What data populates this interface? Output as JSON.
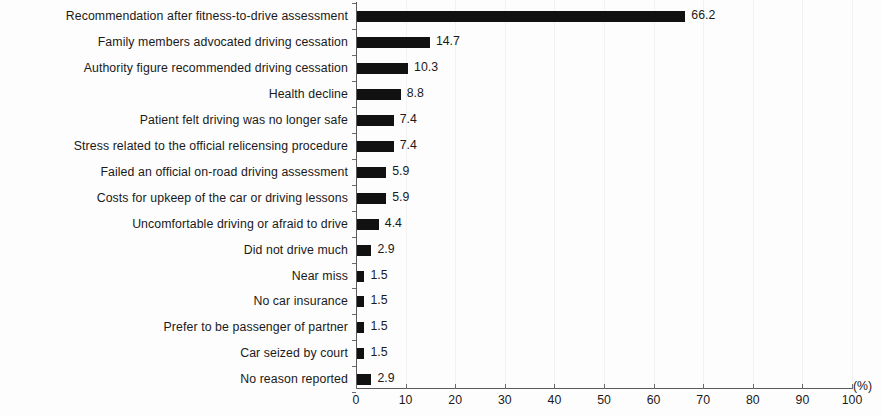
{
  "chart_data": {
    "type": "bar",
    "orientation": "horizontal",
    "title": "",
    "xlabel": "(%)",
    "ylabel": "",
    "xlim": [
      0,
      100
    ],
    "ylim": null,
    "grid": true,
    "legend": null,
    "xticks": [
      "0",
      "10",
      "20",
      "30",
      "40",
      "50",
      "60",
      "70",
      "80",
      "90",
      "100"
    ],
    "xtick_values": [
      0,
      10,
      20,
      30,
      40,
      50,
      60,
      70,
      80,
      90,
      100
    ],
    "categories": [
      "Recommendation after fitness-to-drive assessment",
      "Family members advocated driving cessation",
      "Authority figure recommended driving cessation",
      "Health decline",
      "Patient felt driving was no longer safe",
      "Stress related to the official relicensing procedure",
      "Failed an official on-road driving assessment",
      "Costs for upkeep of the car or driving lessons",
      "Uncomfortable driving or afraid to drive",
      "Did not drive much",
      "Near miss",
      "No car insurance",
      "Prefer to be passenger of partner",
      "Car seized by court",
      "No reason reported"
    ],
    "values": [
      66.2,
      14.7,
      10.3,
      8.8,
      7.4,
      7.4,
      5.9,
      5.9,
      4.4,
      2.9,
      1.5,
      1.5,
      1.5,
      1.5,
      2.9
    ],
    "value_labels": [
      "66.2",
      "14.7",
      "10.3",
      "8.8",
      "7.4",
      "7.4",
      "5.9",
      "5.9",
      "4.4",
      "2.9",
      "1.5",
      "1.5",
      "1.5",
      "1.5",
      "2.9"
    ],
    "bar_color": "#111111",
    "axis_color": "#5a5a5a",
    "grid_color": "#f2f2f2",
    "background_color": "#fdfdfd"
  }
}
